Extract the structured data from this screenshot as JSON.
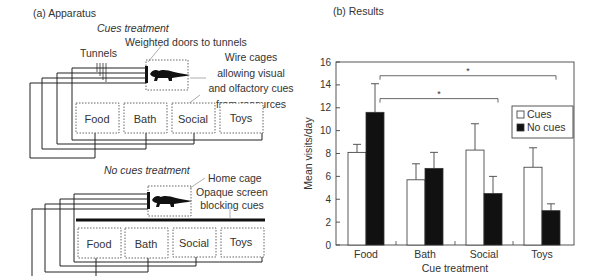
{
  "panel_a": {
    "title": "(a) Apparatus",
    "cues_section": {
      "heading": "Cues treatment",
      "labels": {
        "tunnels": "Tunnels",
        "weighted_doors": "Weighted doors to tunnels",
        "wire_cages_line1": "Wire cages",
        "wire_cages_line2": "allowing visual",
        "wire_cages_line3": "and olfactory cues",
        "wire_cages_line4": "from resources"
      },
      "rooms": [
        "Food",
        "Bath",
        "Social",
        "Toys"
      ]
    },
    "no_cues_section": {
      "heading": "No cues treatment",
      "labels": {
        "home_cage": "Home cage",
        "opaque_line1": "Opaque screen",
        "opaque_line2": "blocking cues"
      },
      "rooms": [
        "Food",
        "Bath",
        "Social",
        "Toys"
      ]
    },
    "icons": [
      "ferret-icon",
      "ferret-icon"
    ]
  },
  "panel_b": {
    "title": "(b) Results"
  },
  "chart_data": {
    "type": "bar",
    "title": "(b) Results",
    "xlabel": "Cue treatment",
    "ylabel": "Mean visits/day",
    "categories": [
      "Food",
      "Bath",
      "Social",
      "Toys"
    ],
    "series": [
      {
        "name": "Cues",
        "color": "#ffffff",
        "values": [
          8.1,
          5.7,
          8.3,
          6.8
        ],
        "error": [
          0.7,
          1.4,
          2.3,
          1.7
        ]
      },
      {
        "name": "No cues",
        "color": "#111111",
        "values": [
          11.6,
          6.7,
          4.5,
          3.0
        ],
        "error": [
          2.5,
          1.4,
          1.5,
          0.6
        ]
      }
    ],
    "ylim": [
      0,
      16
    ],
    "yticks": [
      0,
      2,
      4,
      6,
      8,
      10,
      12,
      14,
      16
    ],
    "grid": false,
    "legend_position": "upper right",
    "annotations": [
      {
        "type": "significance_bracket",
        "from": "Food",
        "to": "Social",
        "label": "*",
        "y": 12.8
      },
      {
        "type": "significance_bracket",
        "from": "Food",
        "to": "Toys",
        "label": "*",
        "y": 14.8
      }
    ]
  }
}
